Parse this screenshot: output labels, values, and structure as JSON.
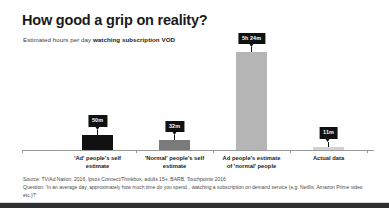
{
  "header": {
    "title": "How good a grip on reality?",
    "subtitle_plain": "Estimated hours per day ",
    "subtitle_strong": "watching subscription VOD"
  },
  "chart_data": {
    "type": "bar",
    "title": "How good a grip on reality?",
    "subtitle": "Estimated hours per day watching subscription VOD",
    "xlabel": "",
    "ylabel": "",
    "grid": false,
    "legend": "none",
    "ylim": [
      0,
      324
    ],
    "unit": "minutes per day",
    "categories": [
      "'Ad' people's self estimate",
      "'Normal' people's self estimate",
      "Ad people's estimate of 'normal' people",
      "Actual data"
    ],
    "category_lines": [
      [
        "'Ad' people's self",
        "estimate"
      ],
      [
        "'Normal' people's self",
        "estimate"
      ],
      [
        "Ad people's estimate",
        "of 'normal' people"
      ],
      [
        "Actual data"
      ]
    ],
    "values": [
      50,
      32,
      324,
      11
    ],
    "data_labels": [
      "50m",
      "32m",
      "5h 24m",
      "11m"
    ],
    "colors": [
      "#111111",
      "#7a7a7a",
      "#b5b5b5",
      "#d2d2d2"
    ]
  },
  "footnote": {
    "source": "Source: TV/Ad Nation, 2016, Ipsos Connect/Thinkbox, adults 15+, BARB, Touchpoints 2016",
    "question": "Question: 'In an average day, approximately how much time do you spend…watching a subscription on demand service (e.g. Netflix, Amazon Prime video etc.)?'"
  }
}
